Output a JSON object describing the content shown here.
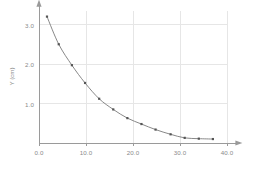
{
  "chart_data": {
    "type": "line",
    "title": "",
    "subtitle": "",
    "xlabel": "",
    "ylabel": "Y (cm)",
    "xlim": [
      0.0,
      42.0
    ],
    "ylim": [
      0.0,
      3.35
    ],
    "grid": true,
    "legend": false,
    "legend_position": "none",
    "x_ticks": [
      0.0,
      10.0,
      20.0,
      30.0,
      40.0
    ],
    "x_tick_labels": [
      "0.0",
      "10.0",
      "20.0",
      "30.0",
      "40.0"
    ],
    "y_ticks": [
      1.0,
      2.0,
      3.0
    ],
    "y_tick_labels": [
      "1.0",
      "2.0",
      "3.0"
    ],
    "marker": "square",
    "line_color": "#7a7a7a",
    "marker_color": "#555555",
    "grid_color": "#e6e6e6",
    "axis_color": "#9a9a9a",
    "tick_label_color": "#8a8a8a",
    "series": [
      {
        "name": "Y",
        "x": [
          1.7,
          4.2,
          7.0,
          9.8,
          12.8,
          15.8,
          18.8,
          21.8,
          24.8,
          28.0,
          31.0,
          34.0,
          37.0
        ],
        "y": [
          3.2,
          2.5,
          1.97,
          1.52,
          1.12,
          0.85,
          0.63,
          0.48,
          0.34,
          0.22,
          0.13,
          0.11,
          0.1
        ]
      }
    ]
  },
  "axes": {
    "x_arrow": true,
    "y_arrow": true
  }
}
